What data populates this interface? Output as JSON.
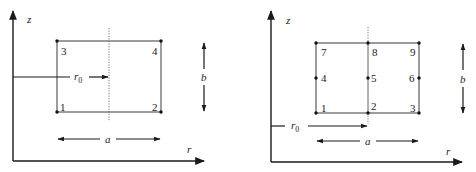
{
  "figures": [
    {
      "id": "four-node-element",
      "axes": {
        "vertical_label": "z",
        "horizontal_label": "r"
      },
      "dimensions": {
        "width_label": "a",
        "height_label": "b",
        "radius_label": "r",
        "radius_subscript": "0"
      },
      "nodes": [
        {
          "label": "1",
          "position": "bottom-left"
        },
        {
          "label": "2",
          "position": "bottom-right"
        },
        {
          "label": "3",
          "position": "top-left"
        },
        {
          "label": "4",
          "position": "top-right"
        }
      ]
    },
    {
      "id": "nine-node-element",
      "axes": {
        "vertical_label": "z",
        "horizontal_label": "r"
      },
      "dimensions": {
        "width_label": "a",
        "height_label": "b",
        "radius_label": "r",
        "radius_subscript": "0"
      },
      "nodes": [
        {
          "label": "1",
          "position": "bottom-left"
        },
        {
          "label": "2",
          "position": "bottom-center"
        },
        {
          "label": "3",
          "position": "bottom-right"
        },
        {
          "label": "4",
          "position": "middle-left"
        },
        {
          "label": "5",
          "position": "center"
        },
        {
          "label": "6",
          "position": "middle-right"
        },
        {
          "label": "7",
          "position": "top-left"
        },
        {
          "label": "8",
          "position": "top-center"
        },
        {
          "label": "9",
          "position": "top-right"
        }
      ]
    }
  ],
  "colors": {
    "ink": "#1a1a1a",
    "edge": "#3a3a3a",
    "background": "#ffffff"
  }
}
